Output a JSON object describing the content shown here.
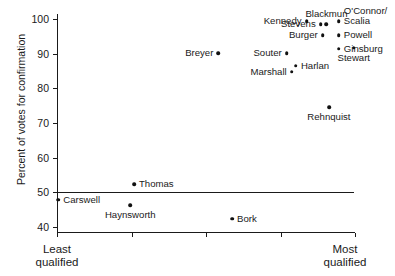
{
  "chart_data": {
    "type": "scatter",
    "title": "",
    "xlabel": "",
    "ylabel": "Percent of votes for confirmation",
    "xlim": [
      0,
      12
    ],
    "ylim": [
      38.5,
      101.5
    ],
    "grid": false,
    "legend": "none",
    "x_axis": {
      "tick_count": 5,
      "tick_labels": [
        "",
        "",
        "",
        "",
        ""
      ],
      "end_label_low": "Least\nqualified",
      "end_label_low_line1": "Least",
      "end_label_low_line2": "qualified",
      "end_label_high_line1": "Most",
      "end_label_high_line2": "qualified"
    },
    "y_axis": {
      "ticks": [
        40,
        50,
        60,
        70,
        80,
        90,
        100
      ],
      "tick_labels": [
        "40",
        "50",
        "60",
        "70",
        "80",
        "90",
        "100"
      ]
    },
    "reference_line": {
      "orientation": "horizontal",
      "value": 50,
      "x_start": 0,
      "x_end": 11.95,
      "color": "#1a1a1a"
    },
    "point_color": "#111111",
    "points": [
      {
        "label": "Carswell",
        "x": 0.05,
        "y": 47.8,
        "label_pos": "right"
      },
      {
        "label": "Haynsworth",
        "x": 2.95,
        "y": 46.2,
        "label_pos": "below"
      },
      {
        "label": "Thomas",
        "x": 3.1,
        "y": 52.3,
        "label_pos": "right"
      },
      {
        "label": "Bork",
        "x": 7.05,
        "y": 42.3,
        "label_pos": "right"
      },
      {
        "label": "Breyer",
        "x": 6.5,
        "y": 90.2,
        "label_pos": "left"
      },
      {
        "label": "Souter",
        "x": 9.25,
        "y": 90.2,
        "label_pos": "left"
      },
      {
        "label": "Marshall",
        "x": 9.45,
        "y": 84.8,
        "label_pos": "left"
      },
      {
        "label": "Harlan",
        "x": 9.62,
        "y": 86.6,
        "label_pos": "right"
      },
      {
        "label": "Rehnquist",
        "x": 10.95,
        "y": 74.5,
        "label_pos": "below"
      },
      {
        "label": "Kennedy",
        "x": 10.05,
        "y": 99.4,
        "label_pos": "left"
      },
      {
        "label": "Stevens",
        "x": 10.62,
        "y": 98.6,
        "label_pos": "left"
      },
      {
        "label": "Blackmun",
        "x": 10.85,
        "y": 98.6,
        "label_pos": "above"
      },
      {
        "label": "Burger",
        "x": 10.7,
        "y": 95.3,
        "label_pos": "left"
      },
      {
        "label": "O'Connor/",
        "x": 11.35,
        "y": 99.4,
        "label_pos": "above-right"
      },
      {
        "label": "Scalia",
        "x": 11.35,
        "y": 99.4,
        "label_pos": "right"
      },
      {
        "label": "Powell",
        "x": 11.35,
        "y": 95.3,
        "label_pos": "right"
      },
      {
        "label": "Ginsburg",
        "x": 11.35,
        "y": 91.5,
        "label_pos": "right"
      },
      {
        "label": "Stewart",
        "x": 11.95,
        "y": 91.8,
        "label_pos": "below"
      }
    ]
  }
}
